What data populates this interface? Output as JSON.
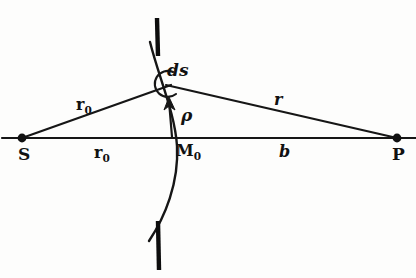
{
  "figure": {
    "kind": "hand-drawn-optics-diagram",
    "background_color": "#fdfdfc",
    "ink_color": "#111111"
  },
  "points": [
    {
      "id": "S",
      "label": "S",
      "x": 22,
      "y": 138,
      "dot": true
    },
    {
      "id": "P",
      "label": "P",
      "x": 397,
      "y": 138,
      "dot": true
    },
    {
      "id": "M0",
      "label_main": "M",
      "label_sub": "0",
      "x": 171,
      "y": 138,
      "dot": false
    },
    {
      "id": "Q",
      "label": "",
      "x": 167,
      "y": 86,
      "dot": false
    }
  ],
  "labels": {
    "S": "S",
    "P": "P",
    "M0_main": "M",
    "M0_sub": "0",
    "r0_ray_main": "r",
    "r0_ray_sub": "0",
    "r0_axis_main": "r",
    "r0_axis_sub": "0",
    "r_ray": "r",
    "b_axis": "b",
    "ds": "ds",
    "rho": "ρ"
  },
  "segments": {
    "optical_axis": {
      "x1": 2,
      "y1": 138,
      "x2": 416,
      "y2": 138,
      "name": "optical-axis"
    },
    "ray_S_to_Q": {
      "x1": 22,
      "y1": 138,
      "x2": 170,
      "y2": 85,
      "name": "incident-ray-r0"
    },
    "ray_Q_to_P": {
      "x1": 168,
      "y1": 85,
      "x2": 397,
      "y2": 138,
      "name": "diffracted-ray-r"
    },
    "rho_arrow": {
      "x1": 171,
      "y1": 138,
      "x2": 169,
      "y2": 99,
      "name": "rho-arrow"
    }
  },
  "wavefront": {
    "name": "spherical-wavefront-arc",
    "path": "M 152 44 C 160 80, 176 115, 178 146 C 180 182, 166 216, 150 240",
    "curvature": "convex toward P"
  },
  "aperture": {
    "top_bar": {
      "x": 157,
      "y1": 18,
      "y2": 56,
      "name": "aperture-edge-top"
    },
    "bottom_bar": {
      "x": 158,
      "y1": 222,
      "y2": 270,
      "name": "aperture-edge-bottom"
    }
  },
  "element_marker": {
    "name": "ds-arc-marker",
    "cx": 166,
    "cy": 84,
    "r": 13
  }
}
